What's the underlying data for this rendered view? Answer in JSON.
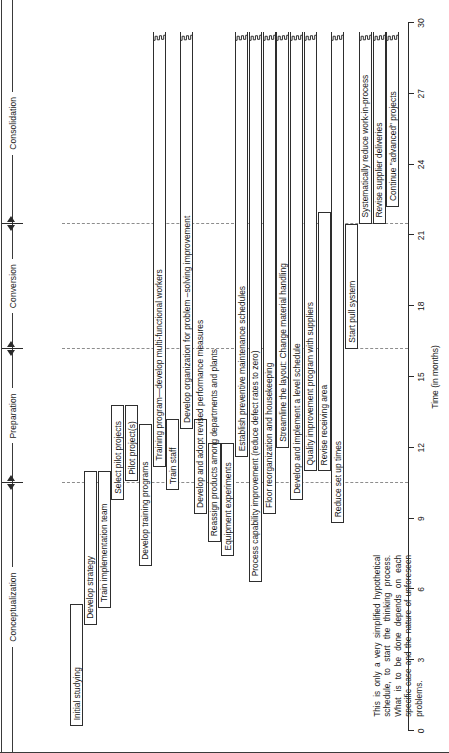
{
  "chart_data": {
    "type": "bar",
    "chart_kind": "gantt",
    "title": "",
    "xlabel": "Time (in months)",
    "ylabel": "",
    "xlim": [
      0,
      30
    ],
    "xticks": [
      0,
      3,
      6,
      9,
      12,
      15,
      18,
      21,
      24,
      27,
      30
    ],
    "grid": false,
    "legend": "none",
    "orientation": "rotated-90",
    "phases": [
      {
        "label": "Conceptualization",
        "start": 0,
        "end": 10.5
      },
      {
        "label": "Preparation",
        "start": 10.5,
        "end": 16.2
      },
      {
        "label": "Conversion",
        "start": 16.2,
        "end": 21.5
      },
      {
        "label": "Consolidation",
        "start": 21.5,
        "end": 30
      }
    ],
    "phase_dividers": [
      10.5,
      16.2,
      21.5
    ],
    "tasks": [
      {
        "label": "Initial studying",
        "start": 0.2,
        "end": 5.4,
        "ragged": false,
        "thick": false
      },
      {
        "label": "Develop strategy",
        "start": 4.5,
        "end": 11.0,
        "ragged": false,
        "thick": false
      },
      {
        "label": "Train implementation team",
        "start": 5.2,
        "end": 11.0,
        "ragged": false,
        "thick": false
      },
      {
        "label": "Select pilot projects",
        "start": 9.8,
        "end": 13.8,
        "ragged": false,
        "thick": false
      },
      {
        "label": "Pilot project(s)",
        "start": 10.6,
        "end": 13.8,
        "ragged": false,
        "thick": false
      },
      {
        "label": "Develop training programs",
        "start": 7.0,
        "end": 13.0,
        "ragged": false,
        "thick": false
      },
      {
        "label": "Training program—develop multi-functional workers",
        "start": 11.2,
        "end": 29.6,
        "ragged": true,
        "thick": false
      },
      {
        "label": "Train staff",
        "start": 10.2,
        "end": 13.2,
        "ragged": false,
        "thick": false
      },
      {
        "label": "Develop organization for problem –solving improvement",
        "start": 12.8,
        "end": 29.6,
        "ragged": true,
        "thick": false
      },
      {
        "label": "Develop and adopt revised performance measures",
        "start": 9.2,
        "end": 13.2,
        "ragged": false,
        "thick": false
      },
      {
        "label": "Reassign products among departments and plants",
        "start": 8.0,
        "end": 12.2,
        "ragged": false,
        "thick": false
      },
      {
        "label": "Equipment experiments",
        "start": 7.4,
        "end": 12.2,
        "ragged": false,
        "thick": false
      },
      {
        "label": "Establish preventive maintenance schedules",
        "start": 11.6,
        "end": 29.6,
        "ragged": true,
        "thick": false
      },
      {
        "label": "Process capability improvement (reduce defect rates to zero)",
        "start": 6.3,
        "end": 29.6,
        "ragged": true,
        "thick": false
      },
      {
        "label": "Floor reorganization and housekeeping",
        "start": 9.2,
        "end": 29.6,
        "ragged": true,
        "thick": false
      },
      {
        "label": "Streamline the layout: Change material handling",
        "start": 12.0,
        "end": 29.6,
        "ragged": true,
        "thick": false
      },
      {
        "label": "Develop and implement a level schedule",
        "start": 9.8,
        "end": 29.6,
        "ragged": true,
        "thick": false
      },
      {
        "label": "Quality improvement program with suppliers",
        "start": 11.0,
        "end": 29.6,
        "ragged": true,
        "thick": false
      },
      {
        "label": "Revise receiving area",
        "start": 11.0,
        "end": 22.0,
        "ragged": false,
        "thick": false
      },
      {
        "label": "Reduce set up times",
        "start": 8.8,
        "end": 29.6,
        "ragged": true,
        "thick": false
      },
      {
        "label": "Start pull system",
        "start": 16.2,
        "end": 21.5,
        "ragged": false,
        "thick": true
      },
      {
        "label": "Systematically reduce work-in-process",
        "start": 21.5,
        "end": 29.6,
        "ragged": true,
        "thick": false
      },
      {
        "label": "Revise supplier deliveries",
        "start": 21.5,
        "end": 29.6,
        "ragged": true,
        "thick": false
      },
      {
        "label": "Continue \"advanced\" projects",
        "start": 22.2,
        "end": 29.6,
        "ragged": true,
        "thick": false
      }
    ]
  },
  "note": {
    "text": "This is only a very simplified hypothetical schedule, to start the thinking process. What is to be done depends on each specific case and the nature of unforeseen problems."
  },
  "colors": {
    "line": "#2a2a2a",
    "bar_fill": "#ffffff",
    "bar_border": "#2e2e2e",
    "dashed_divider": "#8d8d8d",
    "text": "#151515"
  }
}
